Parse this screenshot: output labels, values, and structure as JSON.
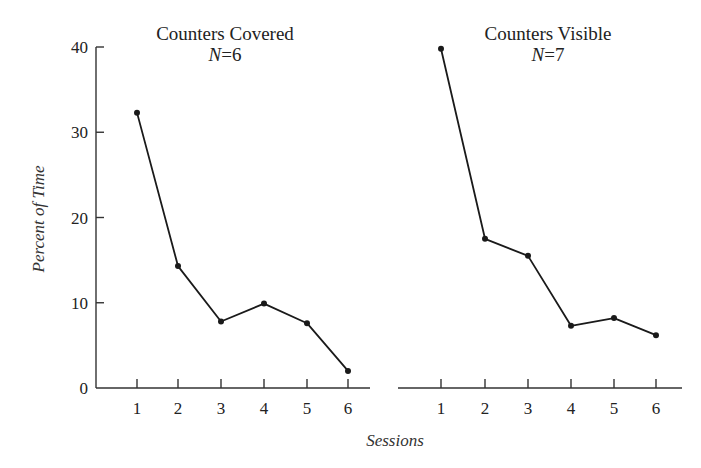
{
  "chart_data": [
    {
      "type": "line",
      "title": "Counters Covered",
      "subtitle_italic": "N",
      "subtitle_rest": "=6",
      "n": 6,
      "xlabel": "Sessions",
      "ylabel": "Percent of Time",
      "x": [
        1,
        2,
        3,
        4,
        5,
        6
      ],
      "values": [
        32.3,
        14.3,
        7.8,
        9.9,
        7.6,
        2.0
      ],
      "ylim": [
        0,
        40
      ],
      "yticks": [
        0,
        10,
        20,
        30,
        40
      ],
      "xticks": [
        1,
        2,
        3,
        4,
        5,
        6
      ],
      "grid": false
    },
    {
      "type": "line",
      "title": "Counters Visible",
      "subtitle_italic": "N",
      "subtitle_rest": "=7",
      "n": 7,
      "xlabel": "Sessions",
      "ylabel": "Percent of Time",
      "x": [
        1,
        2,
        3,
        4,
        5,
        6
      ],
      "values": [
        39.8,
        17.5,
        15.5,
        7.3,
        8.2,
        6.2
      ],
      "ylim": [
        0,
        40
      ],
      "yticks": [
        0,
        10,
        20,
        30,
        40
      ],
      "xticks": [
        1,
        2,
        3,
        4,
        5,
        6
      ],
      "grid": false
    }
  ],
  "labels": {
    "ylabel": "Percent of Time",
    "xlabel": "Sessions"
  },
  "colors": {
    "line": "#1a1a1a",
    "axis": "#333333",
    "background": "#ffffff"
  }
}
